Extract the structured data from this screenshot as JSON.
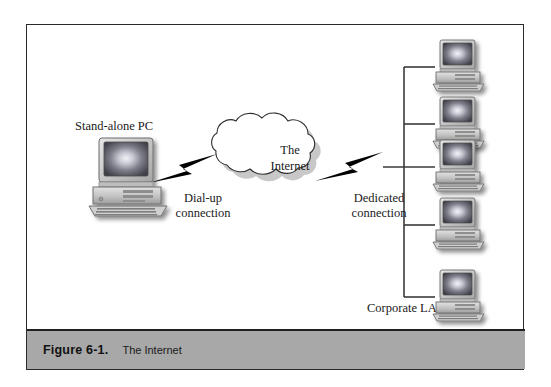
{
  "figure": {
    "caption_number": "Figure 6-1.",
    "caption_title": "The Internet"
  },
  "diagram": {
    "cloud": {
      "line1": "The",
      "line2": "Internet"
    },
    "labels": {
      "standalone_pc": "Stand-alone PC",
      "corporate_lan": "Corporate LAN",
      "dialup_line1": "Dial-up",
      "dialup_line2": "connection",
      "dedicated_line1": "Dedicated",
      "dedicated_line2": "connection"
    },
    "colors": {
      "frame_border": "#2b2b2b",
      "caption_bar": "#a8a8a8",
      "bolt": "#000000",
      "lan_bus": "#3a3a3a",
      "screen_dark": "#4a4a52",
      "screen_glow": "#e8e8f0",
      "case_light": "#d4d4d4",
      "case_mid": "#b0b0b0"
    },
    "lan_nodes": 5
  }
}
